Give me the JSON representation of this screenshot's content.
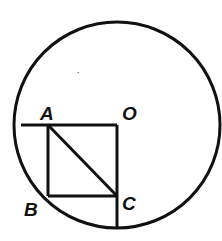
{
  "diagram": {
    "stroke_color": "#111111",
    "background": "#ffffff",
    "circle": {
      "cx": 117,
      "cy": 125,
      "r": 103
    },
    "labels": {
      "A": "A",
      "O": "O",
      "B": "B",
      "C": "C"
    },
    "points": {
      "A": [
        48,
        125
      ],
      "O": [
        117,
        125
      ],
      "B": [
        48,
        196
      ],
      "C": [
        117,
        196
      ]
    }
  }
}
